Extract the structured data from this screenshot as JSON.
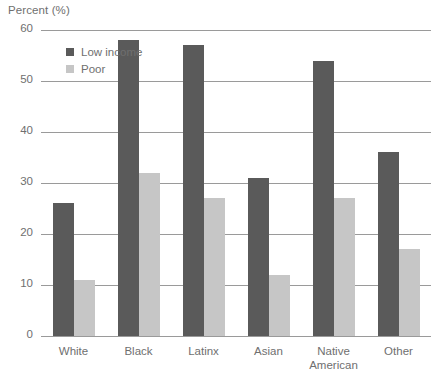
{
  "chart_data": {
    "type": "bar",
    "title": "Percent (%)",
    "xlabel": "",
    "ylabel": "Percent (%)",
    "ylim": [
      0,
      60
    ],
    "yticks": [
      0,
      10,
      20,
      30,
      40,
      50,
      60
    ],
    "grid": true,
    "legend_position": "top-left-inside",
    "categories": [
      "White",
      "Black",
      "Latinx",
      "Native American",
      "Asian",
      "Other"
    ],
    "category_lines": [
      [
        "White"
      ],
      [
        "Black"
      ],
      [
        "Latinx"
      ],
      [
        "Asian"
      ],
      [
        "Native",
        "American"
      ],
      [
        "Other"
      ]
    ],
    "ordered_categories": [
      "White",
      "Black",
      "Latinx",
      "Asian",
      "Native American",
      "Other"
    ],
    "series": [
      {
        "name": "Low income",
        "color": "#5a5a5a",
        "values": [
          26,
          58,
          57,
          31,
          54,
          36
        ]
      },
      {
        "name": "Poor",
        "color": "#c6c6c6",
        "values": [
          11,
          32,
          27,
          12,
          27,
          17
        ]
      }
    ]
  },
  "axis": {
    "title": "Percent (%)",
    "tick_labels": [
      "60",
      "50",
      "40",
      "30",
      "20",
      "10",
      "0"
    ]
  },
  "legend": {
    "items": [
      {
        "label": "Low income",
        "color": "#5a5a5a"
      },
      {
        "label": "Poor",
        "color": "#c6c6c6"
      }
    ]
  },
  "colors": {
    "low_income": "#5a5a5a",
    "poor": "#c6c6c6",
    "gridline": "#9a9a9a",
    "text": "#6f6f6f",
    "background": "#ffffff"
  }
}
